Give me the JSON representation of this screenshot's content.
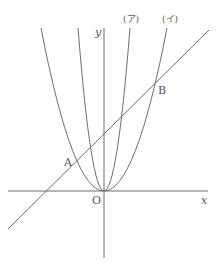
{
  "diagram": {
    "axes": {
      "x_label": "x",
      "y_label": "y",
      "origin_label": "O"
    },
    "curves": [
      {
        "label": "(ア)",
        "type": "parabola",
        "description": "narrow parabola through O"
      },
      {
        "label": "(イ)",
        "type": "parabola",
        "description": "wide parabola through O"
      }
    ],
    "line": {
      "description": "straight line intersecting parabola (イ) at A and B"
    },
    "points": [
      {
        "label": "A"
      },
      {
        "label": "B"
      }
    ],
    "colors": {
      "stroke": "#6e6e6e",
      "text": "#555555",
      "background": "#ffffff"
    }
  }
}
